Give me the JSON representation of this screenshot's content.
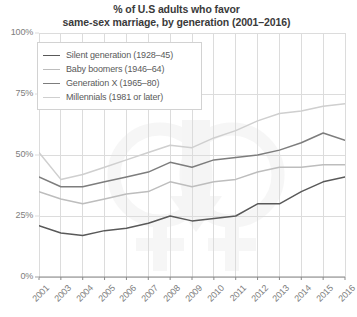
{
  "chart_data": {
    "type": "line",
    "title": "% of U.S adults who favor same-sex marriage, by generation (2001–2016)",
    "title_line1": "% of U.S adults who favor",
    "title_line2": "same-sex marriage, by generation (2001–2016)",
    "xlabel": "",
    "ylabel": "",
    "x": [
      "2001",
      "2003",
      "2004",
      "2005",
      "2006",
      "2007",
      "2008",
      "2009",
      "2010",
      "2011",
      "2012",
      "2013",
      "2014",
      "2015",
      "2016"
    ],
    "categories": [
      "2001",
      "2003",
      "2004",
      "2005",
      "2006",
      "2007",
      "2008",
      "2009",
      "2010",
      "2011",
      "2012",
      "2013",
      "2014",
      "2015",
      "2016"
    ],
    "xtick_labels": [
      "2001",
      "2003",
      "2004",
      "2005",
      "2006",
      "2007",
      "2008",
      "2009",
      "2010",
      "2011",
      "2012",
      "2013",
      "2014",
      "2015",
      "2016"
    ],
    "ytick_labels": [
      "0%",
      "25%",
      "50%",
      "75%",
      "100%"
    ],
    "ytick_values": [
      0,
      25,
      50,
      75,
      100
    ],
    "ylim": [
      0,
      100
    ],
    "grid": true,
    "legend_position": "upper-left",
    "series": [
      {
        "name": "Silent generation (1928–45)",
        "color": "#595959",
        "values": [
          21,
          18,
          17,
          19,
          20,
          22,
          25,
          23,
          24,
          25,
          30,
          30,
          35,
          39,
          41
        ]
      },
      {
        "name": "Baby boomers (1946–64)",
        "color": "#bdbdbd",
        "values": [
          35,
          32,
          30,
          32,
          34,
          35,
          39,
          37,
          39,
          40,
          43,
          45,
          45,
          46,
          46
        ]
      },
      {
        "name": "Generation X (1965–80)",
        "color": "#7d7d7d",
        "values": [
          41,
          37,
          37,
          39,
          41,
          43,
          47,
          45,
          48,
          49,
          50,
          52,
          55,
          59,
          56
        ]
      },
      {
        "name": "Millennials (1981 or later)",
        "color": "#cfcfcf",
        "values": [
          51,
          40,
          42,
          45,
          48,
          51,
          54,
          53,
          57,
          60,
          64,
          67,
          68,
          70,
          71
        ]
      }
    ]
  },
  "legend": {
    "items": [
      {
        "label": "Silent generation (1928–45)",
        "color": "#595959"
      },
      {
        "label": "Baby boomers (1946–64)",
        "color": "#bdbdbd"
      },
      {
        "label": "Generation X (1965–80)",
        "color": "#7d7d7d"
      },
      {
        "label": "Millennials (1981 or later)",
        "color": "#cfcfcf"
      }
    ]
  },
  "colors": {
    "grid": "#dcdcdc",
    "axis": "#8a8a8a",
    "text": "#7d7d7d",
    "title": "#3a3a3a",
    "watermark": "#f1f1f1",
    "background": "#ffffff"
  }
}
